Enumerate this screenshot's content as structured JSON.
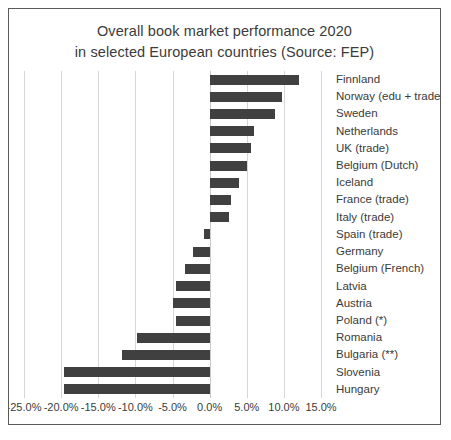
{
  "chart_data": {
    "type": "bar",
    "orientation": "horizontal",
    "title": "Overall book market performance 2020\nin selected European countries (Source: FEP)",
    "xlabel": "",
    "ylabel": "",
    "xlim": [
      -25.0,
      15.0
    ],
    "xticks": [
      -25.0,
      -20.0,
      -15.0,
      -10.0,
      -5.0,
      0.0,
      5.0,
      10.0,
      15.0
    ],
    "xtick_labels": [
      "-25.0%",
      "-20.0%",
      "-15.0%",
      "-10.0%",
      "-5.0%",
      "0.0%",
      "5.0%",
      "10.0%",
      "15.0%"
    ],
    "grid": true,
    "legend": false,
    "bar_color": "#404040",
    "categories": [
      "Finnland",
      "Norway (edu + trade)",
      "Sweden",
      "Netherlands",
      "UK (trade)",
      "Belgium (Dutch)",
      "Iceland",
      "France (trade)",
      "Italy (trade)",
      "Spain (trade)",
      "Germany",
      "Belgium (French)",
      "Latvia",
      "Austria",
      "Poland (*)",
      "Romania",
      "Bulgaria (**)",
      "Slovenia",
      "Hungary"
    ],
    "values": [
      12.0,
      9.7,
      8.8,
      6.0,
      5.6,
      5.0,
      4.0,
      2.9,
      2.6,
      -0.8,
      -2.3,
      -3.3,
      -4.5,
      -5.0,
      -4.5,
      -9.8,
      -11.8,
      -19.6,
      -19.6
    ]
  }
}
